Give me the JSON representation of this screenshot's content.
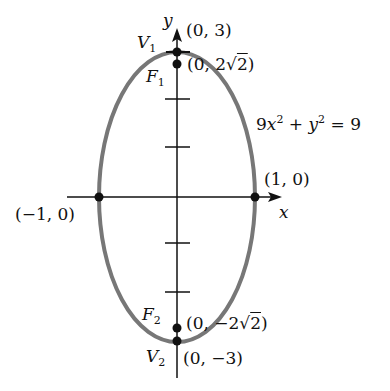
{
  "figure": {
    "equation": {
      "lhs_a": "9",
      "var_x": "x",
      "exp1": "2",
      "plus": " + ",
      "var_y": "y",
      "exp2": "2",
      "rhs": " = 9"
    },
    "axes": {
      "x_label": "x",
      "y_label": "y"
    },
    "points": {
      "v1": {
        "name": "V",
        "sub": "1",
        "coord": "(0, 3)"
      },
      "f1": {
        "name": "F",
        "sub": "1",
        "coord_prefix": "(0, 2",
        "coord_root": "2",
        "coord_suffix": ")"
      },
      "right": {
        "coord": "(1, 0)"
      },
      "left": {
        "coord": "(−1, 0)"
      },
      "f2": {
        "name": "F",
        "sub": "2",
        "coord_prefix": "(0, −2",
        "coord_root": "2",
        "coord_suffix": ")"
      },
      "v2": {
        "name": "V",
        "sub": "2",
        "coord": "(0, −3)"
      }
    },
    "colors": {
      "ellipse": "#777777",
      "axis": "#111111",
      "point": "#111111"
    }
  }
}
